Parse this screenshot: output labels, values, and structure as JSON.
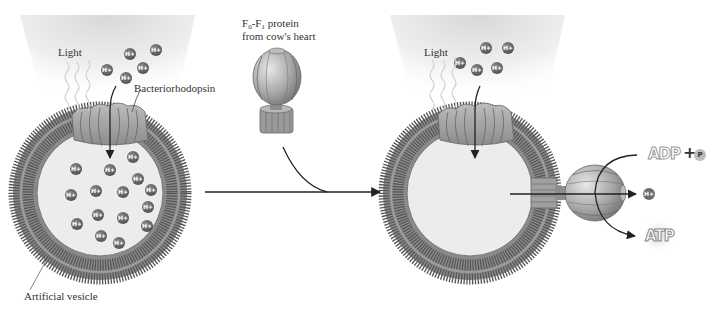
{
  "labels": {
    "light_left": "Light",
    "bacteriorhodopsin": "Bacteriorhodopsin",
    "artificial_vesicle": "Artificial vesicle",
    "f0f1_prefix": "F",
    "f0f1_sub0": "0",
    "f0f1_dash": "-F",
    "f0f1_sub1": "1",
    "f0f1_rest": " protein",
    "f0f1_line2": "from cow's heart",
    "light_right": "Light",
    "adp": "ADP",
    "plus": "+",
    "phosphate": "P",
    "atp": "ATP",
    "proton": "H+"
  },
  "colors": {
    "membrane": "#7a7a7a",
    "membrane_dark": "#5a5a5a",
    "interior": "#ececec",
    "proton_fill": "#6b6b6b",
    "protein": "#a8a8a8",
    "arrow": "#222222",
    "glow": "#e6e6e6"
  },
  "protons_outside_left": [
    [
      130,
      54
    ],
    [
      156,
      50
    ],
    [
      143,
      68
    ],
    [
      107,
      70
    ],
    [
      126,
      78
    ]
  ],
  "protons_inside_left": [
    [
      76,
      169
    ],
    [
      110,
      170
    ],
    [
      133,
      157
    ],
    [
      138,
      179
    ],
    [
      71,
      195
    ],
    [
      96,
      191
    ],
    [
      123,
      192
    ],
    [
      151,
      190
    ],
    [
      148,
      207
    ],
    [
      98,
      215
    ],
    [
      123,
      218
    ],
    [
      77,
      224
    ],
    [
      147,
      226
    ],
    [
      101,
      236
    ],
    [
      119,
      243
    ]
  ],
  "protons_outside_right": [
    [
      486,
      48
    ],
    [
      508,
      48
    ],
    [
      460,
      63
    ],
    [
      477,
      70
    ],
    [
      497,
      68
    ]
  ],
  "protons_inside_right": [
    [
      452,
      163
    ],
    [
      487,
      158
    ],
    [
      504,
      152
    ],
    [
      463,
      178
    ],
    [
      501,
      183
    ],
    [
      521,
      183
    ],
    [
      439,
      180
    ],
    [
      452,
      200
    ],
    [
      477,
      195
    ],
    [
      426,
      205
    ],
    [
      495,
      208
    ],
    [
      518,
      208
    ],
    [
      473,
      217
    ],
    [
      443,
      228
    ],
    [
      508,
      228
    ],
    [
      463,
      238
    ],
    [
      491,
      238
    ]
  ]
}
